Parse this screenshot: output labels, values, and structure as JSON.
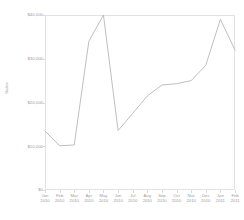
{
  "chart_data": {
    "type": "line",
    "title": "",
    "xlabel": "",
    "ylabel": "Sales",
    "ylim": [
      0,
      40000
    ],
    "grid": false,
    "legend": false,
    "y_ticks": [
      0,
      10000,
      20000,
      30000,
      40000
    ],
    "y_tick_labels": [
      "$0",
      "$10,000",
      "$20,000",
      "$30,000",
      "$40,000"
    ],
    "categories": [
      "Jan 2010",
      "Feb 2010",
      "Mar 2010",
      "Apr 2010",
      "May 2010",
      "Jun 2010",
      "Jul 2010",
      "Aug 2010",
      "Sep 2010",
      "Oct 2010",
      "Nov 2010",
      "Dec 2010",
      "Jan 2011",
      "Feb 2011"
    ],
    "x_tick_labels": [
      {
        "month": "Jan",
        "year": "2010"
      },
      {
        "month": "Feb",
        "year": "2010"
      },
      {
        "month": "Mar",
        "year": "2010"
      },
      {
        "month": "Apr",
        "year": "2010"
      },
      {
        "month": "May",
        "year": "2010"
      },
      {
        "month": "Jun",
        "year": "2010"
      },
      {
        "month": "Jul",
        "year": "2010"
      },
      {
        "month": "Aug",
        "year": "2010"
      },
      {
        "month": "Sep",
        "year": "2010"
      },
      {
        "month": "Oct",
        "year": "2010"
      },
      {
        "month": "Nov",
        "year": "2010"
      },
      {
        "month": "Dec",
        "year": "2010"
      },
      {
        "month": "Jan",
        "year": "2011"
      },
      {
        "month": "Feb",
        "year": "2011"
      }
    ],
    "values": [
      13500,
      10100,
      10300,
      34000,
      40000,
      13600,
      17500,
      21500,
      24000,
      24300,
      25000,
      28500,
      39000,
      32000
    ],
    "series": [
      {
        "name": "Sales",
        "color": "#b8b8b8",
        "values": [
          13500,
          10100,
          10300,
          34000,
          40000,
          13600,
          17500,
          21500,
          24000,
          24300,
          25000,
          28500,
          39000,
          32000
        ]
      }
    ],
    "colors": {
      "line": "#b8b8b8",
      "axis": "#e2e2e2",
      "text": "#9c9c9c",
      "background": "#ffffff"
    }
  }
}
